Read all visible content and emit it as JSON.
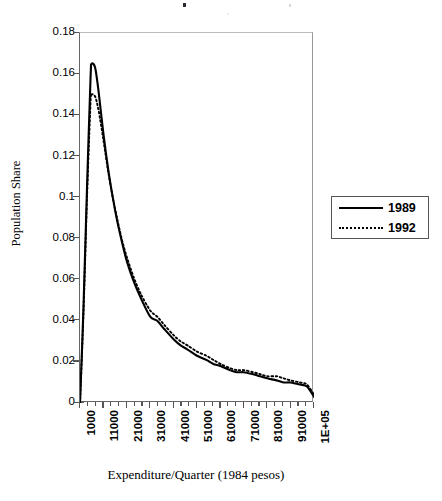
{
  "chart_data": {
    "type": "line",
    "title": "",
    "xlabel": "Expenditure/Quarter (1984 pesos)",
    "ylabel": "Population Share",
    "xtick_labels": [
      "1000",
      "11000",
      "21000",
      "31000",
      "41000",
      "51000",
      "61000",
      "71000",
      "81000",
      "91000",
      "1E+05"
    ],
    "xtick_values": [
      1000,
      11000,
      21000,
      31000,
      41000,
      51000,
      61000,
      71000,
      81000,
      91000,
      101000
    ],
    "ytick_labels": [
      "0",
      "0.02",
      "0.04",
      "0.06",
      "0.08",
      "0.1",
      "0.12",
      "0.14",
      "0.16",
      "0.18"
    ],
    "ytick_values": [
      0,
      0.02,
      0.04,
      0.06,
      0.08,
      0.1,
      0.12,
      0.14,
      0.16,
      0.18
    ],
    "xlim": [
      1000,
      101000
    ],
    "ylim": [
      0,
      0.18
    ],
    "grid": false,
    "minor_xticks_per_interval": 3,
    "legend_position": "right-outside",
    "x": [
      1000,
      2500,
      4000,
      5500,
      6000,
      7500,
      9000,
      11000,
      13000,
      15000,
      17000,
      19000,
      21000,
      24000,
      27000,
      31000,
      34000,
      37000,
      41000,
      44000,
      47000,
      51000,
      55000,
      58000,
      61000,
      65000,
      68000,
      71000,
      75000,
      78000,
      81000,
      85000,
      88000,
      91000,
      95000,
      98000,
      101000
    ],
    "series": [
      {
        "name": "1989",
        "style": "solid",
        "color": "#000000",
        "values": [
          0.0,
          0.047,
          0.105,
          0.158,
          0.165,
          0.163,
          0.151,
          0.131,
          0.114,
          0.1,
          0.088,
          0.078,
          0.069,
          0.059,
          0.051,
          0.042,
          0.04,
          0.036,
          0.031,
          0.028,
          0.026,
          0.023,
          0.021,
          0.019,
          0.018,
          0.016,
          0.015,
          0.015,
          0.014,
          0.013,
          0.012,
          0.011,
          0.01,
          0.01,
          0.009,
          0.008,
          0.003
        ]
      },
      {
        "name": "1992",
        "style": "dotted",
        "color": "#000000",
        "values": [
          0.0,
          0.044,
          0.1,
          0.146,
          0.15,
          0.149,
          0.142,
          0.128,
          0.113,
          0.1,
          0.089,
          0.079,
          0.071,
          0.061,
          0.053,
          0.045,
          0.042,
          0.038,
          0.033,
          0.03,
          0.028,
          0.025,
          0.023,
          0.021,
          0.019,
          0.017,
          0.016,
          0.016,
          0.015,
          0.014,
          0.013,
          0.013,
          0.012,
          0.011,
          0.01,
          0.009,
          0.004
        ]
      }
    ]
  },
  "legend": {
    "items": [
      {
        "label": "1989",
        "style": "solid"
      },
      {
        "label": "1992",
        "style": "dotted"
      }
    ]
  },
  "axes": {
    "y_title": "Population Share",
    "x_title": "Expenditure/Quarter (1984 pesos)"
  }
}
